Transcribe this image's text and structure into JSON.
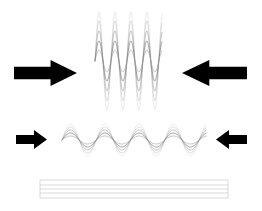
{
  "figure": {
    "background_color": "#ffffff",
    "width": 262,
    "height": 211
  },
  "palette": {
    "arrow_fill": "#000000",
    "wave_stroke_dark": "#6e6e6e",
    "wave_stroke_mid": "#9a9a9a",
    "wave_stroke_light": "#c2c2c2",
    "wave_stroke_faint": "#dcdcdc",
    "bar_stroke": "#c8c8c8"
  },
  "rows": [
    {
      "id": "row-top",
      "name": "compressed-wave-row",
      "arrow_left": {
        "name": "arrow-right-large",
        "direction": "right",
        "size": "large",
        "x": 14,
        "y": 60,
        "width": 63,
        "height": 26,
        "fill": "#000000"
      },
      "arrow_right": {
        "name": "arrow-left-large",
        "direction": "left",
        "size": "large",
        "x": 182,
        "y": 60,
        "width": 65,
        "height": 26,
        "fill": "#000000"
      },
      "wave": {
        "name": "high-frequency-wave-bundle",
        "x_start": 95,
        "x_end": 162,
        "center_y": 61,
        "cycles": 4.2,
        "amplitude_max": 49,
        "line_count": 5,
        "description": "tall narrow high-frequency wave bundle squeezed between two large opposing arrows"
      }
    },
    {
      "id": "row-middle",
      "name": "relaxed-wave-row",
      "arrow_left": {
        "name": "arrow-right-small",
        "direction": "right",
        "size": "small",
        "x": 16,
        "y": 130,
        "width": 31,
        "height": 19,
        "fill": "#000000"
      },
      "arrow_right": {
        "name": "arrow-left-small",
        "direction": "left",
        "size": "small",
        "x": 216,
        "y": 130,
        "width": 31,
        "height": 19,
        "fill": "#000000"
      },
      "wave": {
        "name": "low-frequency-wave-bundle",
        "x_start": 62,
        "x_end": 206,
        "center_y": 140,
        "cycles": 4.2,
        "amplitude_max": 16,
        "line_count": 5,
        "description": "wide low-frequency low-amplitude wave bundle between two small opposing arrows"
      }
    },
    {
      "id": "row-bottom",
      "name": "flattened-wave-row",
      "arrow_left": null,
      "arrow_right": null,
      "wave": {
        "name": "flattened-wave-bundle",
        "x_start": 40,
        "x_end": 228,
        "center_y": 189,
        "cycles": 0,
        "amplitude_max": 0,
        "line_count": 5,
        "description": "fully flattened wave rendered as parallel horizontal lines inside a thin outlined bar"
      }
    }
  ],
  "wave_data": {
    "type": "line",
    "title": "Wave compression sequence",
    "series": [
      {
        "name": "compressed-wave",
        "row": "row-top",
        "frequency_cycles": 4.2,
        "amplitude": 49,
        "x_range": [
          95,
          162
        ],
        "center_y": 61,
        "strand_amplitudes": [
          49,
          40,
          30,
          20,
          11
        ],
        "strand_colors": [
          "#dcdcdc",
          "#c2c2c2",
          "#9a9a9a",
          "#6e6e6e",
          "#9a9a9a"
        ]
      },
      {
        "name": "relaxed-wave",
        "row": "row-middle",
        "frequency_cycles": 4.2,
        "amplitude": 16,
        "x_range": [
          62,
          206
        ],
        "center_y": 140,
        "strand_amplitudes": [
          16,
          13,
          10,
          7,
          4
        ],
        "strand_colors": [
          "#dcdcdc",
          "#c2c2c2",
          "#9a9a9a",
          "#6e6e6e",
          "#9a9a9a"
        ]
      },
      {
        "name": "flattened-wave",
        "row": "row-bottom",
        "frequency_cycles": 0,
        "amplitude": 0,
        "x_range": [
          40,
          228
        ],
        "center_y": 189,
        "strand_amplitudes": [
          9,
          4,
          0,
          -4,
          -9
        ],
        "strand_colors": [
          "#c8c8c8",
          "#c8c8c8",
          "#c8c8c8",
          "#c8c8c8",
          "#c8c8c8"
        ]
      }
    ]
  }
}
